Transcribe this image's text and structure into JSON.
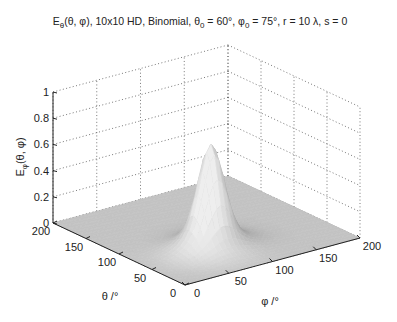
{
  "chart_data": {
    "type": "surface",
    "title_parts": {
      "main": "E",
      "sub1": "θ",
      "rest1": "(θ, φ), 10x10 HD, Binomial, θ",
      "sub2": "0",
      "rest2": " = 60°,  φ",
      "sub3": "0",
      "rest3": " = 75°, r = 10 λ, s = 0"
    },
    "xlabel": "φ /°",
    "ylabel": "θ /°",
    "zlabel": "E_φ(θ, φ)",
    "zlabel_parts": {
      "main": "E",
      "sub": "φ",
      "rest": "(θ, φ)"
    },
    "x_ticks": [
      "0",
      "50",
      "100",
      "150",
      "200"
    ],
    "y_ticks": [
      "0",
      "50",
      "100",
      "150",
      "200"
    ],
    "z_ticks": [
      "0",
      "0.2",
      "0.4",
      "0.6",
      "0.8",
      "1"
    ],
    "xlim": [
      0,
      200
    ],
    "ylim": [
      0,
      200
    ],
    "zlim": [
      0,
      1
    ],
    "grid": true,
    "peak": {
      "theta": 60,
      "phi": 75,
      "value": 0.8
    },
    "colormap": "gray"
  }
}
